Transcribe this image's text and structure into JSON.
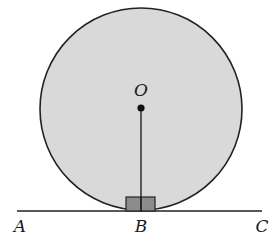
{
  "diagram": {
    "colors": {
      "circle_fill": "#d9d9d9",
      "stroke": "#222222",
      "right_angle_fill": "#8c8c8c",
      "background": "#ffffff"
    },
    "labels": {
      "center": "O",
      "left_point": "A",
      "tangent_point": "B",
      "right_point": "C"
    },
    "geometry": {
      "circle": {
        "cx": 141,
        "cy": 108,
        "r": 102
      },
      "line": {
        "x1": 17,
        "y1": 211,
        "x2": 262,
        "y2": 211
      },
      "radius_segment": {
        "from": "O",
        "to": "B"
      },
      "right_angle_marker": {
        "at": "B",
        "size": 14
      }
    }
  }
}
